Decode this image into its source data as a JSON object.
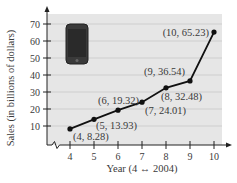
{
  "chart_data": {
    "type": "line",
    "title": "",
    "xlabel": "Year (4 ↔ 2004)",
    "ylabel": "Sales (in billions of dollars)",
    "x": [
      4,
      5,
      6,
      7,
      8,
      9,
      10
    ],
    "series": [
      {
        "name": "Sales",
        "values": [
          8.28,
          13.93,
          19.32,
          24.01,
          32.48,
          36.54,
          65.23
        ]
      }
    ],
    "point_labels": [
      "(4, 8.28)",
      "(5, 13.93)",
      "(6, 19.32)",
      "(7, 24.01)",
      "(8, 32.48)",
      "(9, 36.54)",
      "(10, 65.23)"
    ],
    "xticks": [
      "4",
      "5",
      "6",
      "7",
      "8",
      "9",
      "10"
    ],
    "yticks": [
      "10",
      "20",
      "30",
      "40",
      "50",
      "60",
      "70"
    ],
    "ylim": [
      0,
      75
    ],
    "xlim": [
      3,
      10.5
    ],
    "grid": true,
    "axis_break": true,
    "image_icon": "smartphone-icon",
    "colors": {
      "plot_bg": "#e6e6e6",
      "grid": "#c8c8c8",
      "line": "#111111",
      "text": "#3a3a3a"
    }
  }
}
